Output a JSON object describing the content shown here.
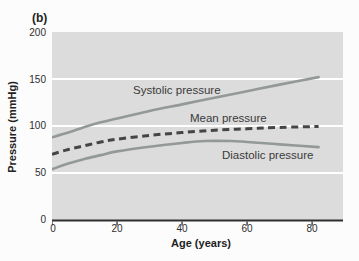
{
  "figure": {
    "panel_label": "(b)",
    "colors": {
      "plot_bg": "#dcdcdc",
      "gridline": "#ffffff",
      "axis": "#2f2f2f",
      "curve": "#939997",
      "dashed": "#454545"
    }
  },
  "chart_data": {
    "type": "line",
    "title": "",
    "xlabel": "Age (years)",
    "ylabel": "Pressure (mmHg)",
    "xlim": [
      0,
      89.5
    ],
    "ylim": [
      0,
      200
    ],
    "x_ticks": [
      0,
      20,
      40,
      60,
      80
    ],
    "y_ticks": [
      200,
      150,
      100,
      50,
      0
    ],
    "gridlines_y": [
      50,
      100,
      150
    ],
    "grid": "horizontal white gridlines on gray panel",
    "legend_position": "inline labels beside curves",
    "series": [
      {
        "name": "Systolic pressure",
        "style": "solid",
        "x": [
          0,
          5,
          10,
          15,
          20,
          30,
          40,
          50,
          60,
          70,
          82
        ],
        "y": [
          88,
          93,
          99,
          104,
          108,
          116,
          123,
          130,
          137,
          144,
          152
        ]
      },
      {
        "name": "Mean pressure",
        "style": "dashed",
        "x": [
          0,
          5,
          10,
          15,
          20,
          30,
          40,
          50,
          60,
          70,
          82
        ],
        "y": [
          70,
          75,
          79,
          83,
          86,
          90,
          93,
          95.5,
          97,
          98.5,
          99.5
        ]
      },
      {
        "name": "Diastolic pressure",
        "style": "solid",
        "x": [
          0,
          5,
          10,
          15,
          20,
          30,
          40,
          47,
          55,
          60,
          70,
          82
        ],
        "y": [
          54,
          60,
          65,
          69,
          73,
          78,
          82,
          84,
          84,
          83,
          80.5,
          77.5
        ]
      }
    ]
  }
}
